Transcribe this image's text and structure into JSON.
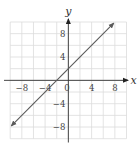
{
  "chart_data": {
    "type": "line",
    "title": "",
    "xlabel": "x",
    "ylabel": "y",
    "xlim": [
      -10,
      10
    ],
    "ylim": [
      -10,
      10
    ],
    "grid": true,
    "grid_step": 2,
    "x_ticks": [
      -8,
      -4,
      0,
      4,
      8
    ],
    "y_ticks": [
      8,
      4,
      -4,
      -8
    ],
    "x_tick_labels": [
      "−8",
      "−4",
      "0",
      "4",
      "8"
    ],
    "y_tick_labels": [
      "8",
      "4",
      "−4",
      "−8"
    ],
    "series": [
      {
        "name": "y = x + 2",
        "equation": "y = x + 2",
        "slope": 1,
        "intercept": 2,
        "x": [
          -9.8,
          7.8
        ],
        "y": [
          -7.8,
          9.8
        ],
        "arrows": "both"
      }
    ],
    "legend": null
  },
  "colors": {
    "grid": "#dcdcdc",
    "axis": "#333333",
    "line": "#5a5a5a",
    "text": "#444444"
  }
}
